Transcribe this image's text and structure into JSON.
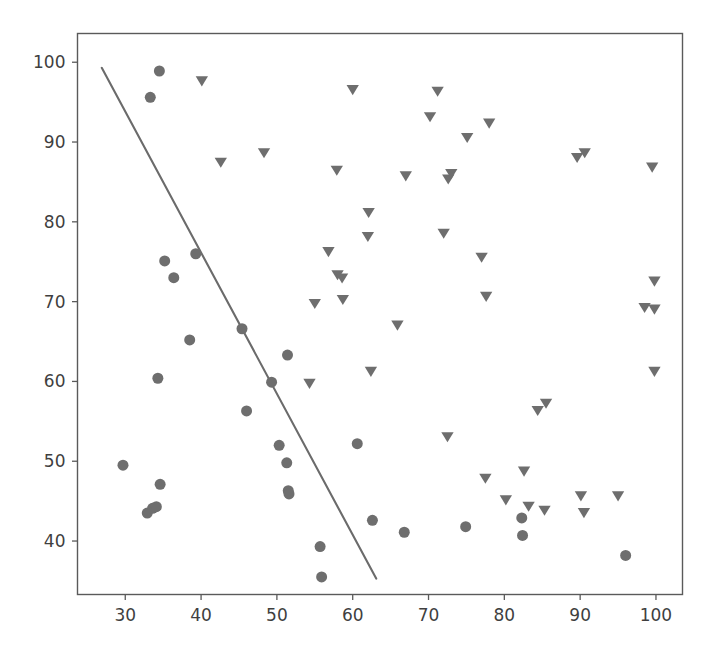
{
  "figure": {
    "background_color": "#ffffff",
    "width": 717,
    "height": 666
  },
  "chart_data": {
    "type": "scatter",
    "title": "",
    "subtitle": "",
    "xlabel": "",
    "ylabel": "",
    "grid": false,
    "legend_position": "none",
    "xlim": [
      23.7,
      103.5
    ],
    "ylim": [
      33.3,
      103.6
    ],
    "xticks": [
      30,
      40,
      50,
      60,
      70,
      80,
      90,
      100
    ],
    "yticks": [
      40,
      50,
      60,
      70,
      80,
      90,
      100
    ],
    "xtick_labels": [
      "30",
      "40",
      "50",
      "60",
      "70",
      "80",
      "90",
      "100"
    ],
    "ytick_labels": [
      "40",
      "50",
      "60",
      "70",
      "80",
      "90",
      "100"
    ],
    "marker_color": "#6e6e6e",
    "line_color": "#6b6b6b",
    "axis_color": "#5a5a5a",
    "tick_label_color": "#3f3f3f",
    "series": [
      {
        "name": "group-circle",
        "marker": "circle",
        "color": "#6e6e6e",
        "size": 11,
        "points": [
          [
            34.5,
            98.9
          ],
          [
            33.3,
            95.6
          ],
          [
            35.2,
            75.1
          ],
          [
            36.4,
            73.0
          ],
          [
            39.3,
            76.0
          ],
          [
            38.5,
            65.2
          ],
          [
            34.3,
            60.4
          ],
          [
            45.4,
            66.6
          ],
          [
            46.0,
            56.3
          ],
          [
            49.3,
            59.9
          ],
          [
            51.4,
            63.3
          ],
          [
            50.3,
            52.0
          ],
          [
            51.3,
            49.8
          ],
          [
            51.5,
            46.3
          ],
          [
            51.6,
            45.9
          ],
          [
            34.6,
            47.1
          ],
          [
            32.9,
            43.5
          ],
          [
            33.6,
            44.1
          ],
          [
            34.1,
            44.3
          ],
          [
            29.7,
            49.5
          ],
          [
            55.7,
            39.3
          ],
          [
            55.9,
            35.5
          ],
          [
            62.6,
            42.6
          ],
          [
            60.6,
            52.2
          ],
          [
            66.8,
            41.1
          ],
          [
            74.9,
            41.8
          ],
          [
            82.4,
            40.7
          ],
          [
            82.3,
            42.9
          ],
          [
            96.0,
            38.2
          ]
        ]
      },
      {
        "name": "group-triangle",
        "marker": "triangle-down",
        "color": "#6e6e6e",
        "size": 11,
        "points": [
          [
            40.1,
            97.6
          ],
          [
            42.6,
            87.4
          ],
          [
            48.3,
            88.6
          ],
          [
            60.0,
            96.5
          ],
          [
            57.9,
            86.4
          ],
          [
            56.8,
            76.2
          ],
          [
            58.0,
            73.3
          ],
          [
            58.6,
            72.9
          ],
          [
            58.7,
            70.2
          ],
          [
            62.1,
            81.1
          ],
          [
            62.0,
            78.1
          ],
          [
            55.0,
            69.7
          ],
          [
            54.3,
            59.7
          ],
          [
            62.4,
            61.2
          ],
          [
            65.9,
            67.0
          ],
          [
            67.0,
            85.7
          ],
          [
            71.2,
            96.3
          ],
          [
            70.2,
            93.1
          ],
          [
            72.0,
            78.5
          ],
          [
            72.6,
            85.3
          ],
          [
            73.0,
            86.0
          ],
          [
            72.5,
            53.0
          ],
          [
            75.1,
            90.5
          ],
          [
            77.0,
            75.5
          ],
          [
            78.0,
            92.3
          ],
          [
            77.6,
            70.6
          ],
          [
            77.5,
            47.8
          ],
          [
            80.2,
            45.1
          ],
          [
            82.6,
            48.7
          ],
          [
            83.2,
            44.3
          ],
          [
            84.4,
            56.3
          ],
          [
            85.5,
            57.2
          ],
          [
            85.3,
            43.8
          ],
          [
            89.6,
            88.0
          ],
          [
            90.6,
            88.6
          ],
          [
            90.1,
            45.6
          ],
          [
            90.5,
            43.5
          ],
          [
            95.0,
            45.6
          ],
          [
            99.5,
            86.8
          ],
          [
            99.8,
            72.5
          ],
          [
            98.5,
            69.2
          ],
          [
            99.8,
            69.0
          ],
          [
            99.8,
            61.2
          ]
        ]
      }
    ],
    "fit_line": {
      "name": "decision-boundary",
      "color": "#6b6b6b",
      "width": 2.1,
      "start": [
        26.9,
        99.3
      ],
      "end": [
        63.1,
        35.3
      ]
    }
  }
}
